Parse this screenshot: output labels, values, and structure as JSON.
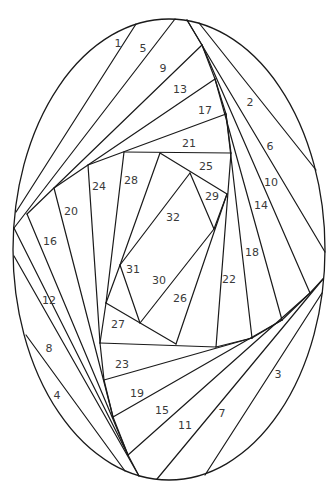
{
  "diagram": {
    "type": "iris-folding-pattern",
    "outline": {
      "shape": "ellipse",
      "cx": 169,
      "cy": 249.5,
      "rx": 156,
      "ry": 230.5
    },
    "stroke_color": "#1a1a1a",
    "label_color": "#3a3a3a",
    "lines": [
      [
        136,
        24,
        16,
        212
      ],
      [
        175,
        19,
        14,
        228
      ],
      [
        202,
        45,
        27,
        214
      ],
      [
        215,
        79,
        54,
        188
      ],
      [
        226,
        114,
        88,
        165
      ],
      [
        124,
        152,
        231,
        153
      ],
      [
        187,
        20,
        202,
        45
      ],
      [
        202,
        45,
        215,
        79
      ],
      [
        215,
        79,
        226,
        114
      ],
      [
        226,
        114,
        231,
        153
      ],
      [
        199,
        23,
        316,
        170
      ],
      [
        187,
        20,
        325,
        252
      ],
      [
        202,
        45,
        310,
        293
      ],
      [
        215,
        79,
        282,
        320
      ],
      [
        226,
        114,
        252,
        338
      ],
      [
        231,
        153,
        216,
        347
      ],
      [
        323,
        279,
        310,
        293
      ],
      [
        310,
        293,
        282,
        320
      ],
      [
        282,
        320,
        252,
        338
      ],
      [
        252,
        338,
        216,
        347
      ],
      [
        322,
        293,
        205,
        475
      ],
      [
        323,
        279,
        157,
        479
      ],
      [
        310,
        293,
        128,
        455
      ],
      [
        282,
        320,
        113,
        417
      ],
      [
        252,
        338,
        104,
        380
      ],
      [
        216,
        347,
        100,
        343
      ],
      [
        14,
        256,
        139,
        476
      ],
      [
        26,
        335,
        125,
        471
      ],
      [
        27,
        214,
        128,
        455
      ],
      [
        54,
        188,
        113,
        417
      ],
      [
        88,
        165,
        100,
        343
      ],
      [
        14,
        228,
        128,
        455
      ],
      [
        100,
        343,
        104,
        380
      ],
      [
        104,
        380,
        113,
        417
      ],
      [
        113,
        417,
        128,
        455
      ],
      [
        128,
        455,
        139,
        476
      ],
      [
        124,
        152,
        106,
        303
      ],
      [
        106,
        303,
        100,
        343
      ],
      [
        106,
        303,
        176,
        344
      ],
      [
        160,
        153,
        120,
        265
      ],
      [
        120,
        265,
        106,
        303
      ],
      [
        160,
        153,
        227,
        194
      ],
      [
        227,
        194,
        176,
        344
      ],
      [
        120,
        265,
        140,
        323
      ],
      [
        140,
        323,
        214,
        229
      ],
      [
        190,
        173,
        214,
        229
      ],
      [
        190,
        173,
        120,
        265
      ],
      [
        214,
        229,
        227,
        194
      ]
    ],
    "labels": [
      {
        "text": "1",
        "x": 118,
        "y": 43
      },
      {
        "text": "2",
        "x": 250,
        "y": 102
      },
      {
        "text": "3",
        "x": 278,
        "y": 374
      },
      {
        "text": "4",
        "x": 57,
        "y": 395
      },
      {
        "text": "5",
        "x": 143,
        "y": 48
      },
      {
        "text": "6",
        "x": 270,
        "y": 146
      },
      {
        "text": "7",
        "x": 222,
        "y": 413
      },
      {
        "text": "8",
        "x": 49,
        "y": 348
      },
      {
        "text": "9",
        "x": 163,
        "y": 68
      },
      {
        "text": "10",
        "x": 271,
        "y": 182
      },
      {
        "text": "11",
        "x": 185,
        "y": 425
      },
      {
        "text": "12",
        "x": 49,
        "y": 300
      },
      {
        "text": "13",
        "x": 180,
        "y": 89
      },
      {
        "text": "14",
        "x": 261,
        "y": 205
      },
      {
        "text": "15",
        "x": 162,
        "y": 410
      },
      {
        "text": "16",
        "x": 50,
        "y": 241
      },
      {
        "text": "17",
        "x": 205,
        "y": 110
      },
      {
        "text": "18",
        "x": 252,
        "y": 252
      },
      {
        "text": "19",
        "x": 137,
        "y": 393
      },
      {
        "text": "20",
        "x": 71,
        "y": 211
      },
      {
        "text": "21",
        "x": 189,
        "y": 143
      },
      {
        "text": "22",
        "x": 229,
        "y": 279
      },
      {
        "text": "23",
        "x": 122,
        "y": 364
      },
      {
        "text": "24",
        "x": 99,
        "y": 186
      },
      {
        "text": "25",
        "x": 206,
        "y": 166
      },
      {
        "text": "26",
        "x": 180,
        "y": 298
      },
      {
        "text": "27",
        "x": 118,
        "y": 324
      },
      {
        "text": "28",
        "x": 131,
        "y": 180
      },
      {
        "text": "29",
        "x": 212,
        "y": 196
      },
      {
        "text": "30",
        "x": 159,
        "y": 280
      },
      {
        "text": "31",
        "x": 133,
        "y": 269
      },
      {
        "text": "32",
        "x": 173,
        "y": 217
      }
    ]
  }
}
